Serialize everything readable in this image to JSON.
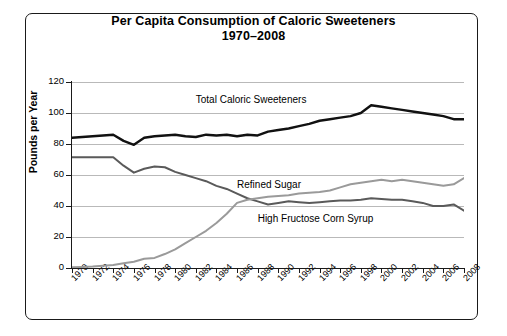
{
  "chart_data": {
    "type": "line",
    "title": "Per Capita Consumption of Caloric Sweeteners",
    "subtitle": "1970–2008",
    "xlabel": "",
    "ylabel": "Pounds per Year",
    "ylim": [
      0,
      120
    ],
    "yticks": [
      0,
      20,
      40,
      60,
      80,
      100,
      120
    ],
    "xlim": [
      1970,
      2008
    ],
    "xticks": [
      1970,
      1972,
      1974,
      1976,
      1978,
      1980,
      1982,
      1984,
      1986,
      1988,
      1990,
      1992,
      1994,
      1996,
      1998,
      2000,
      2002,
      2004,
      2006,
      2008
    ],
    "grid": "horizontal",
    "legend_position": "inline-annotations",
    "x": [
      1970,
      1971,
      1972,
      1973,
      1974,
      1975,
      1976,
      1977,
      1978,
      1979,
      1980,
      1981,
      1982,
      1983,
      1984,
      1985,
      1986,
      1987,
      1988,
      1989,
      1990,
      1991,
      1992,
      1993,
      1994,
      1995,
      1996,
      1997,
      1998,
      1999,
      2000,
      2001,
      2002,
      2003,
      2004,
      2005,
      2006,
      2007,
      2008
    ],
    "series": [
      {
        "name": "Total Caloric Sweeteners",
        "color": "#111111",
        "width": 2.4,
        "values": [
          84,
          84.5,
          85,
          85.5,
          86,
          82,
          79.5,
          84,
          85,
          85.5,
          86,
          85,
          84.5,
          86,
          85.5,
          86,
          85,
          86,
          85.5,
          88,
          89,
          90,
          91.5,
          93,
          95,
          96,
          97,
          98,
          100,
          105,
          104,
          103,
          102,
          101,
          100,
          99,
          98,
          96,
          96
        ]
      },
      {
        "name": "Refined Sugar",
        "color": "#5a5a5a",
        "width": 2.0,
        "values": [
          71.5,
          71.5,
          71.5,
          71.5,
          71.5,
          66,
          61.5,
          64,
          65.5,
          65,
          62,
          60,
          58,
          56,
          53,
          51,
          48,
          45,
          43,
          41,
          42,
          43,
          42.5,
          42,
          42.5,
          43,
          43.5,
          43.5,
          44,
          45,
          44.5,
          44,
          44,
          43,
          42,
          40,
          40,
          41,
          37
        ]
      },
      {
        "name": "High Fructose Corn Syrup",
        "color": "#9a9a9a",
        "width": 2.0,
        "values": [
          0.5,
          0.7,
          1,
          1.5,
          2,
          3,
          4,
          6,
          6.5,
          9,
          12,
          16,
          20,
          24,
          29,
          35,
          42,
          44,
          45,
          46,
          46.5,
          47,
          48,
          48.5,
          49,
          50,
          52,
          54,
          55,
          56,
          57,
          56,
          57,
          56,
          55,
          54,
          53,
          54,
          58
        ]
      }
    ],
    "annotations": [
      {
        "text": "Total Caloric Sweeteners",
        "x": 1982,
        "y": 108
      },
      {
        "text": "Refined Sugar",
        "x": 1986,
        "y": 53
      },
      {
        "text": "High Fructose Corn Syrup",
        "x": 1988,
        "y": 31
      }
    ]
  }
}
